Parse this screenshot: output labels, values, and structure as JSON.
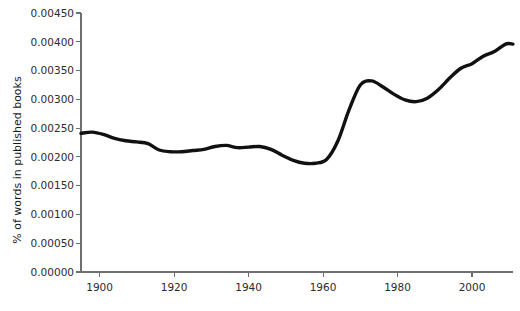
{
  "chart_data": {
    "type": "line",
    "title": "",
    "subtitle": "",
    "xlabel": "",
    "ylabel": "% of words in published books",
    "xlim": [
      1895,
      2011
    ],
    "ylim": [
      0.0,
      0.0045
    ],
    "grid": false,
    "legend": null,
    "xticks": [
      1900,
      1920,
      1940,
      1960,
      1980,
      2000
    ],
    "xtick_labels": [
      "1900",
      "1920",
      "1940",
      "1960",
      "1980",
      "2000"
    ],
    "yticks": [
      0.0,
      0.0005,
      0.001,
      0.0015,
      0.002,
      0.0025,
      0.003,
      0.0035,
      0.004,
      0.0045
    ],
    "ytick_labels": [
      "0.00000",
      "0.00050",
      "0.00100",
      "0.00150",
      "0.00200",
      "0.00250",
      "0.00300",
      "0.00350",
      "0.00400",
      "0.00450"
    ],
    "series": [
      {
        "name": "% of words in published books",
        "color": "#111111",
        "x": [
          1895,
          1898,
          1901,
          1904,
          1907,
          1910,
          1913,
          1916,
          1919,
          1922,
          1925,
          1928,
          1931,
          1934,
          1937,
          1940,
          1943,
          1946,
          1949,
          1952,
          1955,
          1958,
          1961,
          1964,
          1967,
          1970,
          1973,
          1976,
          1979,
          1982,
          1985,
          1988,
          1991,
          1994,
          1997,
          2000,
          2003,
          2006,
          2009,
          2011
        ],
        "y": [
          0.00241,
          0.00243,
          0.00239,
          0.00232,
          0.00228,
          0.00226,
          0.00223,
          0.00212,
          0.00209,
          0.00209,
          0.00211,
          0.00213,
          0.00218,
          0.0022,
          0.00216,
          0.00217,
          0.00218,
          0.00213,
          0.00203,
          0.00194,
          0.00189,
          0.00189,
          0.00196,
          0.00228,
          0.00282,
          0.00325,
          0.00332,
          0.00322,
          0.00309,
          0.00299,
          0.00296,
          0.00302,
          0.00317,
          0.00337,
          0.00354,
          0.00362,
          0.00375,
          0.00383,
          0.00396,
          0.00396
        ]
      }
    ]
  },
  "axis": {
    "y_axis_title": "% of words in published books"
  }
}
